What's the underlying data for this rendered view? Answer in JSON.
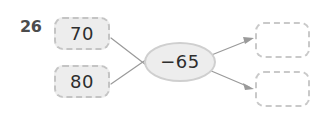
{
  "exercise": {
    "item_number": "26",
    "type": "function-machine",
    "operation": {
      "label": "−65",
      "operator": "−",
      "operand": 65
    },
    "inputs": [
      {
        "label": "70",
        "value": 70
      },
      {
        "label": "80",
        "value": 80
      }
    ],
    "answers": [
      {
        "label": "",
        "placeholder": ""
      },
      {
        "label": "",
        "placeholder": ""
      }
    ],
    "connectors": [
      {
        "from": "input-box-1",
        "to": "operation-node",
        "arrow": false
      },
      {
        "from": "input-box-2",
        "to": "operation-node",
        "arrow": false
      },
      {
        "from": "operation-node",
        "to": "answer-box-1",
        "arrow": true
      },
      {
        "from": "operation-node",
        "to": "answer-box-2",
        "arrow": true
      }
    ]
  },
  "colors": {
    "background": "#ffffff",
    "node_fill": "#ededed",
    "node_border": "#c4c4c4",
    "answer_fill": "#ffffff",
    "answer_border": "#c9c9c9",
    "text": "#2e2e2e",
    "item_number": "#4c4c4c",
    "connector": "#9a9a9a"
  }
}
